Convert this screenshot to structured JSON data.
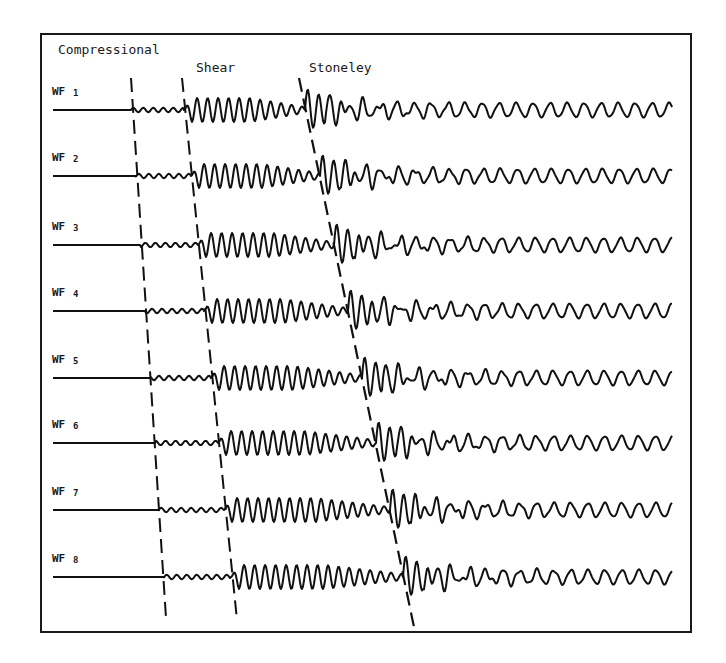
{
  "figure": {
    "frame": {
      "x": 41,
      "y": 34,
      "w": 650,
      "h": 598,
      "color": "#1a1a1a"
    },
    "ink": "#111111",
    "wave_labels": {
      "compressional": {
        "text": "Compressional",
        "x": 58,
        "y": 54
      },
      "shear": {
        "text": "Shear",
        "x": 196,
        "y": 72
      },
      "stoneley": {
        "text": "Stoneley",
        "x": 309,
        "y": 72
      }
    },
    "arrival_lines": {
      "compressional": {
        "x1": 131,
        "y1": 78,
        "x2": 166,
        "y2": 618
      },
      "shear": {
        "x1": 182,
        "y1": 78,
        "x2": 237,
        "y2": 620
      },
      "stoneley": {
        "x1": 299,
        "y1": 78,
        "x2": 414,
        "y2": 627
      }
    },
    "trace_start_x": 53,
    "trace_end_x": 672,
    "traces": [
      {
        "label": "WF",
        "num": "1",
        "baseline": 110,
        "p": 131,
        "s": 184,
        "st": 305,
        "seed": 1
      },
      {
        "label": "WF",
        "num": "2",
        "baseline": 176,
        "p": 135,
        "s": 191,
        "st": 320,
        "seed": 2
      },
      {
        "label": "WF",
        "num": "3",
        "baseline": 245,
        "p": 140,
        "s": 198,
        "st": 334,
        "seed": 3
      },
      {
        "label": "WF",
        "num": "4",
        "baseline": 311,
        "p": 145,
        "s": 204,
        "st": 348,
        "seed": 4
      },
      {
        "label": "WF",
        "num": "5",
        "baseline": 378,
        "p": 150,
        "s": 211,
        "st": 362,
        "seed": 5
      },
      {
        "label": "WF",
        "num": "6",
        "baseline": 443,
        "p": 155,
        "s": 218,
        "st": 376,
        "seed": 6
      },
      {
        "label": "WF",
        "num": "7",
        "baseline": 510,
        "p": 159,
        "s": 224,
        "st": 390,
        "seed": 7
      },
      {
        "label": "WF",
        "num": "8",
        "baseline": 577,
        "p": 163,
        "s": 231,
        "st": 403,
        "seed": 8
      }
    ]
  }
}
